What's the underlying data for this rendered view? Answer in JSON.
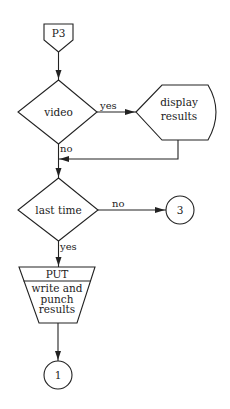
{
  "flowchart": {
    "nodes": {
      "start": {
        "type": "off-page-connector",
        "label": "P3"
      },
      "video": {
        "type": "decision",
        "label": "video"
      },
      "display": {
        "type": "display",
        "line1": "display",
        "line2": "results"
      },
      "last_time": {
        "type": "decision",
        "label": "last time"
      },
      "put": {
        "type": "manual-operation",
        "header": "PUT",
        "line1": "write and",
        "line2": "punch",
        "line3": "results"
      },
      "conn3": {
        "type": "connector",
        "label": "3"
      },
      "conn1": {
        "type": "connector",
        "label": "1"
      }
    },
    "edges": {
      "video_yes": "yes",
      "video_no": "no",
      "last_no": "no",
      "last_yes": "yes"
    }
  }
}
